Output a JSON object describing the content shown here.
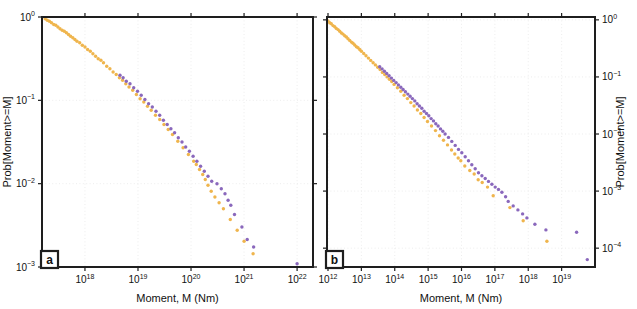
{
  "figure": {
    "background": "#ffffff",
    "frame_color": "#1e1e1e",
    "grid_color": "#e8e8e8",
    "text_color": "#111111",
    "colors": {
      "orange": "#EFB54D",
      "purple": "#8A68BC"
    }
  },
  "chart_data": [
    {
      "type": "scatter",
      "panel": "a",
      "xlabel": "Moment, M (Nm)",
      "ylabel": "Prob[Moment>=M]",
      "ylabel_side": "left",
      "x_scale": "log10",
      "y_scale": "log10",
      "grid": "major-dotted",
      "xlim_log10": [
        17.19,
        22.3
      ],
      "ylim_log10": [
        -3.0,
        0.0
      ],
      "x_tick_exponents": [
        18,
        19,
        20,
        21,
        22
      ],
      "y_tick_exponents": [
        0,
        -1,
        -2,
        -3
      ],
      "series": [
        {
          "name": "orange-ccdf",
          "color": "orange",
          "marker": "circle",
          "points_log10": [
            [
              17.25,
              -0.02
            ],
            [
              17.29,
              -0.04
            ],
            [
              17.33,
              -0.05
            ],
            [
              17.37,
              -0.07
            ],
            [
              17.41,
              -0.09
            ],
            [
              17.45,
              -0.1
            ],
            [
              17.49,
              -0.12
            ],
            [
              17.53,
              -0.14
            ],
            [
              17.57,
              -0.16
            ],
            [
              17.61,
              -0.17
            ],
            [
              17.65,
              -0.19
            ],
            [
              17.69,
              -0.21
            ],
            [
              17.73,
              -0.23
            ],
            [
              17.77,
              -0.25
            ],
            [
              17.81,
              -0.27
            ],
            [
              17.85,
              -0.29
            ],
            [
              17.9,
              -0.31
            ],
            [
              17.95,
              -0.34
            ],
            [
              18.0,
              -0.36
            ],
            [
              18.05,
              -0.39
            ],
            [
              18.1,
              -0.41
            ],
            [
              18.15,
              -0.44
            ],
            [
              18.2,
              -0.47
            ],
            [
              18.25,
              -0.5
            ],
            [
              18.3,
              -0.52
            ],
            [
              18.35,
              -0.55
            ],
            [
              18.41,
              -0.59
            ],
            [
              18.47,
              -0.62
            ],
            [
              18.53,
              -0.66
            ],
            [
              18.59,
              -0.69
            ],
            [
              18.65,
              -0.73
            ],
            [
              18.71,
              -0.76
            ],
            [
              18.77,
              -0.8
            ],
            [
              18.83,
              -0.84
            ],
            [
              18.9,
              -0.88
            ],
            [
              18.97,
              -0.93
            ],
            [
              19.04,
              -0.98
            ],
            [
              19.11,
              -1.02
            ],
            [
              19.18,
              -1.07
            ],
            [
              19.25,
              -1.12
            ],
            [
              19.33,
              -1.18
            ],
            [
              19.41,
              -1.23
            ],
            [
              19.49,
              -1.29
            ],
            [
              19.57,
              -1.35
            ],
            [
              19.65,
              -1.41
            ],
            [
              19.75,
              -1.49
            ],
            [
              19.85,
              -1.57
            ],
            [
              19.95,
              -1.65
            ],
            [
              20.05,
              -1.73
            ],
            [
              20.1,
              -1.77
            ],
            [
              20.16,
              -1.83
            ],
            [
              20.22,
              -1.89
            ],
            [
              20.27,
              -1.95
            ],
            [
              20.32,
              -2.02
            ],
            [
              20.38,
              -2.09
            ],
            [
              20.45,
              -2.16
            ],
            [
              20.53,
              -2.23
            ],
            [
              20.61,
              -2.3
            ],
            [
              20.74,
              -2.43
            ],
            [
              20.87,
              -2.56
            ],
            [
              21.0,
              -2.69
            ],
            [
              21.17,
              -2.84
            ]
          ]
        },
        {
          "name": "purple-ccdf",
          "color": "purple",
          "marker": "circle",
          "points_log10": [
            [
              18.66,
              -0.7
            ],
            [
              18.72,
              -0.73
            ],
            [
              18.78,
              -0.77
            ],
            [
              18.85,
              -0.8
            ],
            [
              18.92,
              -0.85
            ],
            [
              18.99,
              -0.89
            ],
            [
              19.06,
              -0.94
            ],
            [
              19.13,
              -0.99
            ],
            [
              19.2,
              -1.04
            ],
            [
              19.27,
              -1.08
            ],
            [
              19.34,
              -1.13
            ],
            [
              19.41,
              -1.18
            ],
            [
              19.48,
              -1.24
            ],
            [
              19.55,
              -1.29
            ],
            [
              19.62,
              -1.34
            ],
            [
              19.69,
              -1.39
            ],
            [
              19.76,
              -1.45
            ],
            [
              19.83,
              -1.5
            ],
            [
              19.9,
              -1.56
            ],
            [
              19.97,
              -1.61
            ],
            [
              20.04,
              -1.67
            ],
            [
              20.11,
              -1.73
            ],
            [
              20.18,
              -1.79
            ],
            [
              20.25,
              -1.85
            ],
            [
              20.32,
              -1.91
            ],
            [
              20.39,
              -1.97
            ],
            [
              20.49,
              -2.0
            ],
            [
              20.57,
              -2.06
            ],
            [
              20.64,
              -2.12
            ],
            [
              20.7,
              -2.2
            ],
            [
              20.75,
              -2.26
            ],
            [
              20.82,
              -2.37
            ],
            [
              20.96,
              -2.52
            ],
            [
              21.06,
              -2.67
            ],
            [
              21.18,
              -2.76
            ],
            [
              22.0,
              -2.96
            ]
          ]
        }
      ]
    },
    {
      "type": "scatter",
      "panel": "b",
      "xlabel": "Moment, M (Nm)",
      "ylabel": "Prob[Moment>=M]",
      "ylabel_side": "right",
      "x_scale": "log10",
      "y_scale": "log10",
      "grid": "major-dotted",
      "xlim_log10": [
        11.97,
        20.0
      ],
      "ylim_log10": [
        -4.33,
        0.05
      ],
      "x_tick_exponents": [
        12,
        13,
        14,
        15,
        16,
        17,
        18,
        19
      ],
      "y_tick_exponents": [
        0,
        -1,
        -2,
        -3,
        -4
      ],
      "series": [
        {
          "name": "orange-ccdf",
          "color": "orange",
          "marker": "circle",
          "points_log10": [
            [
              12.0,
              -0.02
            ],
            [
              12.05,
              -0.05
            ],
            [
              12.1,
              -0.07
            ],
            [
              12.15,
              -0.1
            ],
            [
              12.2,
              -0.12
            ],
            [
              12.25,
              -0.15
            ],
            [
              12.3,
              -0.17
            ],
            [
              12.35,
              -0.2
            ],
            [
              12.4,
              -0.23
            ],
            [
              12.45,
              -0.25
            ],
            [
              12.5,
              -0.28
            ],
            [
              12.55,
              -0.3
            ],
            [
              12.6,
              -0.33
            ],
            [
              12.65,
              -0.36
            ],
            [
              12.7,
              -0.39
            ],
            [
              12.75,
              -0.41
            ],
            [
              12.8,
              -0.44
            ],
            [
              12.85,
              -0.47
            ],
            [
              12.9,
              -0.49
            ],
            [
              12.95,
              -0.52
            ],
            [
              13.0,
              -0.55
            ],
            [
              13.07,
              -0.59
            ],
            [
              13.14,
              -0.63
            ],
            [
              13.21,
              -0.67
            ],
            [
              13.28,
              -0.71
            ],
            [
              13.35,
              -0.75
            ],
            [
              13.42,
              -0.79
            ],
            [
              13.49,
              -0.83
            ],
            [
              13.56,
              -0.87
            ],
            [
              13.63,
              -0.92
            ],
            [
              13.7,
              -0.96
            ],
            [
              13.77,
              -1.0
            ],
            [
              13.84,
              -1.04
            ],
            [
              13.91,
              -1.08
            ],
            [
              13.98,
              -1.13
            ],
            [
              14.08,
              -1.19
            ],
            [
              14.18,
              -1.25
            ],
            [
              14.28,
              -1.32
            ],
            [
              14.38,
              -1.38
            ],
            [
              14.48,
              -1.45
            ],
            [
              14.58,
              -1.51
            ],
            [
              14.68,
              -1.58
            ],
            [
              14.78,
              -1.64
            ],
            [
              14.88,
              -1.71
            ],
            [
              14.98,
              -1.78
            ],
            [
              15.1,
              -1.86
            ],
            [
              15.22,
              -1.94
            ],
            [
              15.34,
              -2.03
            ],
            [
              15.46,
              -2.11
            ],
            [
              15.58,
              -2.19
            ],
            [
              15.7,
              -2.28
            ],
            [
              15.8,
              -2.35
            ],
            [
              15.9,
              -2.42
            ],
            [
              15.98,
              -2.47
            ],
            [
              16.1,
              -2.56
            ],
            [
              16.25,
              -2.64
            ],
            [
              16.38,
              -2.7
            ],
            [
              16.5,
              -2.8
            ],
            [
              16.62,
              -2.85
            ],
            [
              16.78,
              -2.93
            ],
            [
              16.95,
              -3.08
            ],
            [
              17.45,
              -3.29
            ],
            [
              17.85,
              -3.52
            ],
            [
              18.56,
              -3.88
            ]
          ]
        },
        {
          "name": "purple-ccdf",
          "color": "purple",
          "marker": "circle",
          "points_log10": [
            [
              13.55,
              -0.82
            ],
            [
              13.62,
              -0.86
            ],
            [
              13.69,
              -0.9
            ],
            [
              13.76,
              -0.94
            ],
            [
              13.83,
              -0.98
            ],
            [
              13.9,
              -1.02
            ],
            [
              13.97,
              -1.06
            ],
            [
              14.04,
              -1.1
            ],
            [
              14.11,
              -1.14
            ],
            [
              14.18,
              -1.18
            ],
            [
              14.25,
              -1.22
            ],
            [
              14.32,
              -1.26
            ],
            [
              14.39,
              -1.3
            ],
            [
              14.46,
              -1.34
            ],
            [
              14.53,
              -1.38
            ],
            [
              14.6,
              -1.42
            ],
            [
              14.67,
              -1.47
            ],
            [
              14.74,
              -1.51
            ],
            [
              14.81,
              -1.55
            ],
            [
              14.88,
              -1.6
            ],
            [
              14.95,
              -1.64
            ],
            [
              15.02,
              -1.68
            ],
            [
              15.09,
              -1.73
            ],
            [
              15.16,
              -1.77
            ],
            [
              15.23,
              -1.82
            ],
            [
              15.3,
              -1.86
            ],
            [
              15.37,
              -1.91
            ],
            [
              15.44,
              -1.95
            ],
            [
              15.51,
              -2.0
            ],
            [
              15.61,
              -2.06
            ],
            [
              15.71,
              -2.13
            ],
            [
              15.81,
              -2.2
            ],
            [
              15.91,
              -2.27
            ],
            [
              16.01,
              -2.33
            ],
            [
              16.11,
              -2.4
            ],
            [
              16.21,
              -2.47
            ],
            [
              16.31,
              -2.54
            ],
            [
              16.41,
              -2.61
            ],
            [
              16.51,
              -2.68
            ],
            [
              16.61,
              -2.73
            ],
            [
              16.71,
              -2.78
            ],
            [
              16.81,
              -2.83
            ],
            [
              16.91,
              -2.88
            ],
            [
              17.01,
              -2.93
            ],
            [
              17.11,
              -2.97
            ],
            [
              17.21,
              -3.02
            ],
            [
              17.32,
              -3.1
            ],
            [
              17.4,
              -3.18
            ],
            [
              17.55,
              -3.26
            ],
            [
              17.69,
              -3.33
            ],
            [
              17.83,
              -3.4
            ],
            [
              17.96,
              -3.47
            ],
            [
              18.2,
              -3.58
            ],
            [
              18.53,
              -3.68
            ],
            [
              19.45,
              -3.72
            ],
            [
              19.77,
              -4.2
            ]
          ]
        }
      ]
    }
  ]
}
